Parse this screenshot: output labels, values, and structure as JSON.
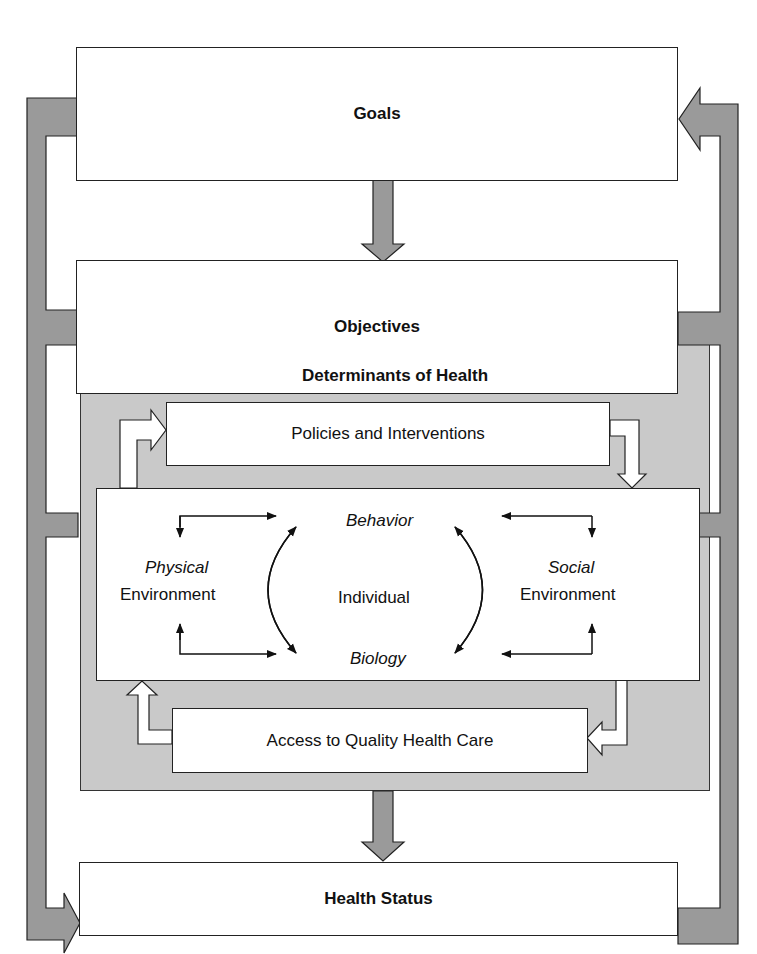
{
  "diagram": {
    "goals": "Goals",
    "objectives": "Objectives",
    "determinants": {
      "title": "Determinants of Health",
      "policies": "Policies and Interventions",
      "access": "Access to Quality Health Care",
      "physical": {
        "italic": "Physical",
        "regular": "Environment"
      },
      "social": {
        "italic": "Social",
        "regular": "Environment"
      },
      "individual": "Individual",
      "behavior": "Behavior",
      "biology": "Biology"
    },
    "health_status": "Health Status"
  },
  "colors": {
    "feedback_arrow": "#9a9a9a",
    "determinants_bg": "#c9c9c9",
    "box_bg": "#ffffff",
    "stroke": "#222222"
  }
}
